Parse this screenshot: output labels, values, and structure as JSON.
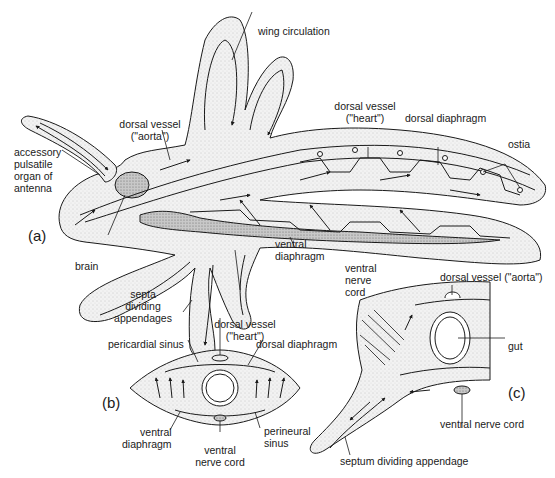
{
  "figure": {
    "panels": {
      "a": {
        "tag": "(a)"
      },
      "b": {
        "tag": "(b)"
      },
      "c": {
        "tag": "(c)"
      }
    },
    "labels_a": {
      "wing_circulation": "wing circulation",
      "dorsal_vessel_aorta": "dorsal vessel\n(\"aorta\")",
      "dorsal_vessel_heart": "dorsal vessel\n(\"heart\")",
      "dorsal_diaphragm": "dorsal diaphragm",
      "ostia": "ostia",
      "accessory_organ": "accessory\npulsatile\norgan of\nantenna",
      "brain": "brain",
      "septa": "septa\ndividing\nappendages",
      "ventral_diaphragm": "ventral\ndiaphragm",
      "ventral_nerve_cord": "ventral\nnerve\ncord"
    },
    "labels_b": {
      "dorsal_vessel_heart": "dorsal vessel\n(\"heart\")",
      "pericardial_sinus": "pericardial sinus",
      "dorsal_diaphragm": "dorsal diaphragm",
      "ventral_diaphragm": "ventral\ndiaphragm",
      "perineural_sinus": "perineural\nsinus",
      "ventral_nerve_cord": "ventral\nnerve cord"
    },
    "labels_c": {
      "dorsal_vessel_aorta": "dorsal vessel (\"aorta\")",
      "gut": "gut",
      "ventral_nerve_cord": "ventral nerve cord",
      "septum": "septum dividing appendage"
    },
    "colors": {
      "line": "#1a1a1a",
      "stipple": "#e6e6e6",
      "organ": "#bdbdbd"
    }
  }
}
